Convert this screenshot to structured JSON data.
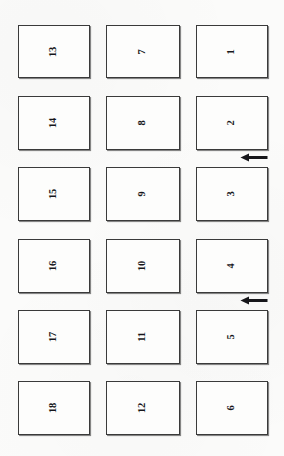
{
  "figure": {
    "kind": "panel-grid-figure",
    "background_color": "#fbfbfa",
    "ink_color": "#16161a",
    "border_color": "#3a3a3a",
    "columns": 3,
    "rows": 6,
    "label_rotation_degrees": -90,
    "panels": [
      {
        "label": "13",
        "column": 1,
        "row": 1,
        "x": 18,
        "y": 25,
        "w": 72,
        "h": 53
      },
      {
        "label": "7",
        "column": 2,
        "row": 1,
        "x": 106,
        "y": 25,
        "w": 74,
        "h": 53
      },
      {
        "label": "1",
        "column": 3,
        "row": 1,
        "x": 196,
        "y": 25,
        "w": 72,
        "h": 53
      },
      {
        "label": "14",
        "column": 1,
        "row": 2,
        "x": 18,
        "y": 96,
        "w": 72,
        "h": 54
      },
      {
        "label": "8",
        "column": 2,
        "row": 2,
        "x": 106,
        "y": 96,
        "w": 74,
        "h": 54
      },
      {
        "label": "2",
        "column": 3,
        "row": 2,
        "x": 196,
        "y": 96,
        "w": 72,
        "h": 54
      },
      {
        "label": "15",
        "column": 1,
        "row": 3,
        "x": 18,
        "y": 167,
        "w": 72,
        "h": 54
      },
      {
        "label": "9",
        "column": 2,
        "row": 3,
        "x": 106,
        "y": 167,
        "w": 74,
        "h": 54
      },
      {
        "label": "3",
        "column": 3,
        "row": 3,
        "x": 196,
        "y": 167,
        "w": 72,
        "h": 54
      },
      {
        "label": "16",
        "column": 1,
        "row": 4,
        "x": 18,
        "y": 239,
        "w": 72,
        "h": 54
      },
      {
        "label": "10",
        "column": 2,
        "row": 4,
        "x": 106,
        "y": 239,
        "w": 74,
        "h": 54
      },
      {
        "label": "4",
        "column": 3,
        "row": 4,
        "x": 196,
        "y": 239,
        "w": 72,
        "h": 54
      },
      {
        "label": "17",
        "column": 1,
        "row": 5,
        "x": 18,
        "y": 310,
        "w": 72,
        "h": 54
      },
      {
        "label": "11",
        "column": 2,
        "row": 5,
        "x": 106,
        "y": 310,
        "w": 74,
        "h": 54
      },
      {
        "label": "5",
        "column": 3,
        "row": 5,
        "x": 196,
        "y": 310,
        "w": 72,
        "h": 54
      },
      {
        "label": "18",
        "column": 1,
        "row": 6,
        "x": 18,
        "y": 381,
        "w": 72,
        "h": 54
      },
      {
        "label": "12",
        "column": 2,
        "row": 6,
        "x": 106,
        "y": 381,
        "w": 74,
        "h": 54
      },
      {
        "label": "6",
        "column": 3,
        "row": 6,
        "x": 196,
        "y": 381,
        "w": 72,
        "h": 54
      }
    ],
    "arrows": [
      {
        "direction": "left",
        "x": 240,
        "y": 152,
        "w": 28,
        "h": 11,
        "between": "2 and 3"
      },
      {
        "direction": "left",
        "x": 240,
        "y": 295,
        "w": 28,
        "h": 11,
        "between": "4 and 5"
      }
    ]
  }
}
